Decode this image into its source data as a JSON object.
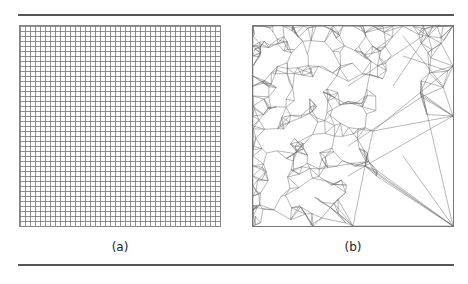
{
  "figure": {
    "panels": [
      {
        "id": "a",
        "caption": "(a)",
        "description": "uniform structured triangular grid mesh"
      },
      {
        "id": "b",
        "caption": "(b)",
        "description": "adaptive unstructured triangular mesh, dense on left, sparse on right"
      }
    ],
    "colors": {
      "rule": "#555555",
      "mesh_line": "#6e6e6e",
      "background": "#ffffff"
    }
  }
}
